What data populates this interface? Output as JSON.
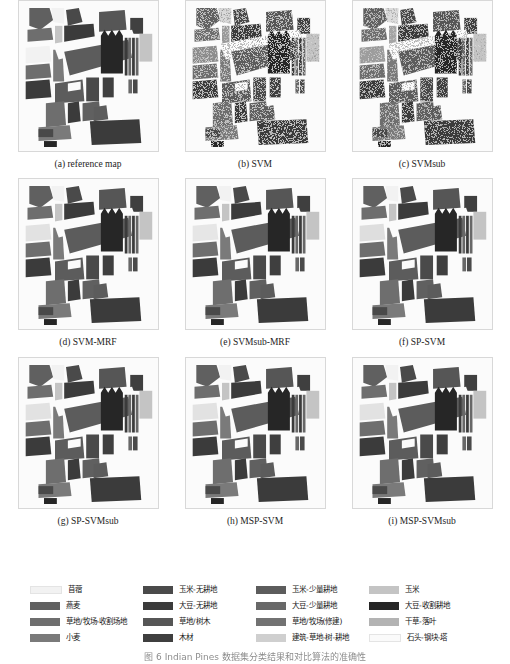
{
  "figure": {
    "caption": "图 6  Indian Pines 数据集分类结果和对比算法的准确性",
    "dataset": "Indian Pines",
    "panels": [
      {
        "id": "a",
        "label": "(a) reference map",
        "style": "clean"
      },
      {
        "id": "b",
        "label": "(b) SVM",
        "style": "noisy"
      },
      {
        "id": "c",
        "label": "(c) SVMsub",
        "style": "noisy"
      },
      {
        "id": "d",
        "label": "(d) SVM-MRF",
        "style": "clean"
      },
      {
        "id": "e",
        "label": "(e) SVMsub-MRF",
        "style": "clean"
      },
      {
        "id": "f",
        "label": "(f) SP-SVM",
        "style": "clean"
      },
      {
        "id": "g",
        "label": "(g) SP-SVMsub",
        "style": "clean"
      },
      {
        "id": "h",
        "label": "(h) MSP-SVM",
        "style": "clean"
      },
      {
        "id": "i",
        "label": "(i) MSP-SVMsub",
        "style": "clean"
      }
    ]
  },
  "legend": {
    "items": [
      {
        "label": "苜蓿",
        "color": "#f2f2f2"
      },
      {
        "label": "玉米-无耕地",
        "color": "#4a4a4a"
      },
      {
        "label": "玉米-少量耕地",
        "color": "#5c5c5c"
      },
      {
        "label": "玉米",
        "color": "#c4c4c4"
      },
      {
        "label": "燕麦",
        "color": "#606060"
      },
      {
        "label": "大豆-无耕地",
        "color": "#3b3b3b"
      },
      {
        "label": "大豆-少量耕地",
        "color": "#686868"
      },
      {
        "label": "大豆-收割耕地",
        "color": "#262626"
      },
      {
        "label": "草地/牧场-收割场地",
        "color": "#6e6e6e"
      },
      {
        "label": "草地/树木",
        "color": "#565656"
      },
      {
        "label": "草地/牧场(修建)",
        "color": "#727272"
      },
      {
        "label": "干草-落叶",
        "color": "#b3b3b3"
      },
      {
        "label": "小麦",
        "color": "#7a7a7a"
      },
      {
        "label": "木材",
        "color": "#3f3f3f"
      },
      {
        "label": "建筑-草地-树-耕地",
        "color": "#cfcfcf"
      },
      {
        "label": "石头-钢块-塔",
        "color": "#fafafa"
      }
    ]
  }
}
